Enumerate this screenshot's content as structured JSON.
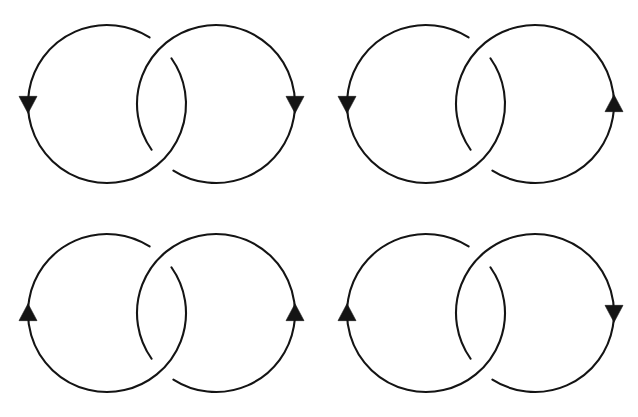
{
  "figure": {
    "background_color": "#ffffff",
    "stroke_color": "#141414",
    "stroke_width": 2.1,
    "canvas": {
      "width": 638,
      "height": 417
    },
    "grid": {
      "columns": 2,
      "rows": 2,
      "cell_width": 319,
      "cell_height": 209
    }
  },
  "geometry": {
    "circle_radius": 79,
    "left_circle_cx": 107,
    "right_circle_cx": 216,
    "circle_cy": 104,
    "crossing_top": {
      "x": 161,
      "y": 47
    },
    "crossing_bottom": {
      "x": 161,
      "y": 161
    },
    "gap_half_angle_degrees": 11,
    "arrow_length": 17,
    "arrow_half_width": 9
  },
  "panels": [
    {
      "id": "panel-top-left",
      "name": "top-left-link",
      "position": "top-left",
      "label": "",
      "left_component": {
        "name": "left-circle",
        "orientation": "clockwise",
        "arrow_direction": "down",
        "arrow_side": "left",
        "arrow_anchor": {
          "x": 28,
          "y": 104
        },
        "over_at": "bottom-crossing",
        "under_at": "top-crossing"
      },
      "right_component": {
        "name": "right-circle",
        "orientation": "counterclockwise",
        "arrow_direction": "down",
        "arrow_side": "right",
        "arrow_anchor": {
          "x": 295,
          "y": 104
        },
        "over_at": "top-crossing",
        "under_at": "bottom-crossing"
      },
      "linking_number": 1
    },
    {
      "id": "panel-top-right",
      "name": "top-right-link",
      "position": "top-right",
      "label": "",
      "left_component": {
        "name": "left-circle",
        "orientation": "clockwise",
        "arrow_direction": "down",
        "arrow_side": "left",
        "arrow_anchor": {
          "x": 28,
          "y": 104
        },
        "over_at": "bottom-crossing",
        "under_at": "top-crossing"
      },
      "right_component": {
        "name": "right-circle",
        "orientation": "clockwise",
        "arrow_direction": "up",
        "arrow_side": "right",
        "arrow_anchor": {
          "x": 295,
          "y": 114
        },
        "over_at": "top-crossing",
        "under_at": "bottom-crossing"
      },
      "linking_number": -1
    },
    {
      "id": "panel-bottom-left",
      "name": "bottom-left-link",
      "position": "bottom-left",
      "label": "",
      "left_component": {
        "name": "left-circle",
        "orientation": "counterclockwise",
        "arrow_direction": "up",
        "arrow_side": "left",
        "arrow_anchor": {
          "x": 28,
          "y": 111
        },
        "over_at": "bottom-crossing",
        "under_at": "top-crossing"
      },
      "right_component": {
        "name": "right-circle",
        "orientation": "clockwise",
        "arrow_direction": "up",
        "arrow_side": "right",
        "arrow_anchor": {
          "x": 295,
          "y": 111
        },
        "over_at": "top-crossing",
        "under_at": "bottom-crossing"
      },
      "linking_number": 1
    },
    {
      "id": "panel-bottom-right",
      "name": "bottom-right-link",
      "position": "bottom-right",
      "label": "",
      "left_component": {
        "name": "left-circle",
        "orientation": "counterclockwise",
        "arrow_direction": "up",
        "arrow_side": "left",
        "arrow_anchor": {
          "x": 28,
          "y": 111
        },
        "over_at": "bottom-crossing",
        "under_at": "top-crossing"
      },
      "right_component": {
        "name": "right-circle",
        "orientation": "counterclockwise",
        "arrow_direction": "down",
        "arrow_side": "right",
        "arrow_anchor": {
          "x": 295,
          "y": 104
        },
        "over_at": "top-crossing",
        "under_at": "bottom-crossing"
      },
      "linking_number": -1
    }
  ]
}
